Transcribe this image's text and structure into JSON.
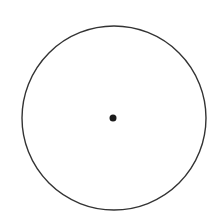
{
  "diagram": {
    "type": "circle-with-center-point",
    "background": "#ffffff",
    "circle": {
      "cx": 114,
      "cy": 118,
      "r": 92,
      "stroke": "#333333",
      "stroke_width": 1.4,
      "fill": "none"
    },
    "center_point": {
      "cx": 113,
      "cy": 118,
      "r": 3.5,
      "fill": "#1a1a1a"
    }
  }
}
